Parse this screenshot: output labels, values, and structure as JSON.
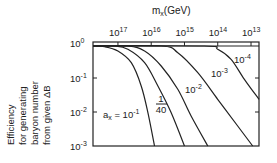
{
  "chart_data": {
    "type": "line",
    "title": "",
    "xlabel": "m_x (GeV)",
    "xlabel_parts": {
      "main": "m",
      "sub": "x",
      "unit": "(GeV)"
    },
    "ylabel": "Efficiency for generating baryon number from given ΔB",
    "ylabel_lines": [
      "Efficiency",
      "for generating",
      "baryon number",
      "from given ΔB"
    ],
    "x_axis": {
      "position": "top",
      "scale": "log",
      "reversed": true,
      "ticks": [
        {
          "base": "10",
          "exp": "17",
          "value": 1e+17
        },
        {
          "base": "10",
          "exp": "16",
          "value": 1e+16
        },
        {
          "base": "10",
          "exp": "15",
          "value": 1000000000000000.0
        },
        {
          "base": "10",
          "exp": "14",
          "value": 100000000000000.0
        },
        {
          "base": "10",
          "exp": "13",
          "value": 10000000000000.0
        }
      ],
      "range_log10": [
        17.75,
        12.76
      ]
    },
    "y_axis": {
      "scale": "log",
      "ticks": [
        {
          "base": "10",
          "exp": "0",
          "value": 1
        },
        {
          "base": "10",
          "exp": "-1",
          "value": 0.1
        },
        {
          "base": "10",
          "exp": "-2",
          "value": 0.01
        },
        {
          "base": "10",
          "exp": "-3",
          "value": 0.001
        }
      ],
      "range": [
        0.001,
        1
      ]
    },
    "grid": false,
    "legend": "inline labels",
    "series": [
      {
        "name": "α_x = 10^-1",
        "label": {
          "prefix": "a",
          "sub": "x",
          "eq": " = 10",
          "exp": "-1"
        },
        "points_log10": [
          [
            17.75,
            0
          ],
          [
            17.4,
            -0.02
          ],
          [
            17.0,
            -0.15
          ],
          [
            16.6,
            -0.5
          ],
          [
            16.3,
            -1.2
          ],
          [
            16.1,
            -2.0
          ],
          [
            15.9,
            -3.0
          ]
        ]
      },
      {
        "name": "α_x = 1/40",
        "label": {
          "num": "1",
          "den": "40"
        },
        "points_log10": [
          [
            17.75,
            0
          ],
          [
            17.1,
            0
          ],
          [
            16.7,
            -0.1
          ],
          [
            16.2,
            -0.5
          ],
          [
            15.8,
            -1.2
          ],
          [
            15.4,
            -2.0
          ],
          [
            15.0,
            -3.0
          ]
        ]
      },
      {
        "name": "α_x = 10^-2",
        "label": {
          "base": "10",
          "exp": "-2"
        },
        "points_log10": [
          [
            17.75,
            0
          ],
          [
            16.7,
            0
          ],
          [
            16.2,
            -0.15
          ],
          [
            15.7,
            -0.6
          ],
          [
            15.2,
            -1.3
          ],
          [
            14.8,
            -2.1
          ],
          [
            14.3,
            -3.0
          ]
        ]
      },
      {
        "name": "α_x = 10^-3",
        "label": {
          "base": "10",
          "exp": "-3"
        },
        "points_log10": [
          [
            17.75,
            0
          ],
          [
            15.7,
            0
          ],
          [
            15.2,
            -0.2
          ],
          [
            14.6,
            -0.8
          ],
          [
            14.0,
            -1.6
          ],
          [
            13.4,
            -2.4
          ],
          [
            12.95,
            -3.0
          ]
        ]
      },
      {
        "name": "α_x = 10^-4",
        "label": {
          "base": "10",
          "exp": "-4"
        },
        "points_log10": [
          [
            17.75,
            0
          ],
          [
            14.4,
            0
          ],
          [
            14.0,
            -0.1
          ],
          [
            13.6,
            -0.4
          ],
          [
            13.2,
            -1.0
          ],
          [
            12.76,
            -1.6
          ]
        ]
      }
    ]
  }
}
